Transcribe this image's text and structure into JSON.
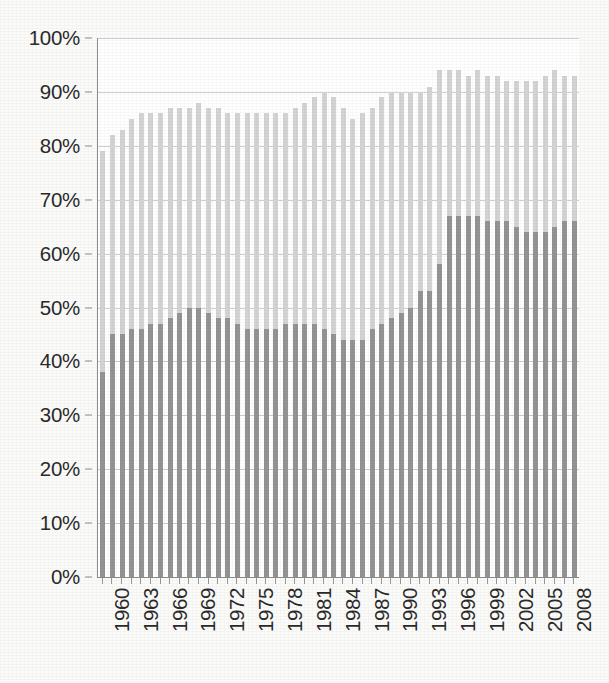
{
  "chart_data": {
    "type": "bar",
    "title": "",
    "subtitle": "",
    "xlabel": "",
    "ylabel": "",
    "grid": true,
    "legend": "none",
    "orientation": "vertical",
    "bar_mode": "overlay",
    "ylim": [
      0,
      100
    ],
    "y_tick_labels": [
      "0%",
      "10%",
      "20%",
      "30%",
      "40%",
      "50%",
      "60%",
      "70%",
      "80%",
      "90%",
      "100%"
    ],
    "y_tick_values": [
      0,
      10,
      20,
      30,
      40,
      50,
      60,
      70,
      80,
      90,
      100
    ],
    "x_tick_labels": [
      "1960",
      "1963",
      "1966",
      "1969",
      "1972",
      "1975",
      "1978",
      "1981",
      "1984",
      "1987",
      "1990",
      "1993",
      "1996",
      "1999",
      "2002",
      "2005",
      "2008"
    ],
    "x_tick_values": [
      1960,
      1963,
      1966,
      1969,
      1972,
      1975,
      1978,
      1981,
      1984,
      1987,
      1990,
      1993,
      1996,
      1999,
      2002,
      2005,
      2008
    ],
    "x_tick_interval": 3,
    "categories": [
      1960,
      1961,
      1962,
      1963,
      1964,
      1965,
      1966,
      1967,
      1968,
      1969,
      1970,
      1971,
      1972,
      1973,
      1974,
      1975,
      1976,
      1977,
      1978,
      1979,
      1980,
      1981,
      1982,
      1983,
      1984,
      1985,
      1986,
      1987,
      1988,
      1989,
      1990,
      1991,
      1992,
      1993,
      1994,
      1995,
      1996,
      1997,
      1998,
      1999,
      2000,
      2001,
      2002,
      2003,
      2004,
      2005,
      2006,
      2007,
      2008,
      2009
    ],
    "colors": {
      "series_back": "#d4d4d4",
      "series_front": "#949494",
      "gridline": "#cfcfcf",
      "axis": "#8d8d8d",
      "text": "#2b2b2b",
      "plot_background": "#ffffff",
      "page_background": "#fbfbfa"
    },
    "series": [
      {
        "name": "series-back",
        "color": "#d4d4d4",
        "values": [
          79,
          82,
          83,
          85,
          86,
          86,
          86,
          87,
          87,
          87,
          88,
          87,
          87,
          86,
          86,
          86,
          86,
          86,
          86,
          86,
          87,
          88,
          89,
          90,
          89,
          87,
          85,
          86,
          87,
          89,
          90,
          90,
          90,
          90,
          91,
          94,
          94,
          94,
          93,
          94,
          93,
          93,
          92,
          92,
          92,
          92,
          93,
          94,
          93,
          93
        ]
      },
      {
        "name": "series-front",
        "color": "#949494",
        "values": [
          38,
          45,
          45,
          46,
          46,
          47,
          47,
          48,
          49,
          50,
          50,
          49,
          48,
          48,
          47,
          46,
          46,
          46,
          46,
          47,
          47,
          47,
          47,
          46,
          45,
          44,
          44,
          44,
          46,
          47,
          48,
          49,
          50,
          53,
          53,
          58,
          67,
          67,
          67,
          67,
          66,
          66,
          66,
          65,
          64,
          64,
          64,
          65,
          66,
          66
        ]
      }
    ]
  }
}
